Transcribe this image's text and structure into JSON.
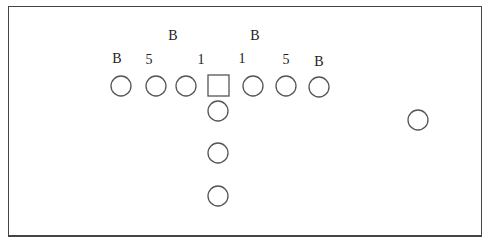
{
  "diagram": {
    "type": "football-formation",
    "labels": [
      {
        "text": "B",
        "x": 173,
        "y": 40
      },
      {
        "text": "B",
        "x": 255,
        "y": 40
      },
      {
        "text": "B",
        "x": 117,
        "y": 63
      },
      {
        "text": "5",
        "x": 149,
        "y": 64
      },
      {
        "text": "1",
        "x": 201,
        "y": 64
      },
      {
        "text": "1",
        "x": 242,
        "y": 63
      },
      {
        "text": "5",
        "x": 286,
        "y": 64
      },
      {
        "text": "B",
        "x": 319,
        "y": 66
      }
    ],
    "center": {
      "shape": "square",
      "x": 208,
      "y": 75,
      "size": 21
    },
    "line_players": [
      {
        "cx": 121,
        "cy": 86
      },
      {
        "cx": 156,
        "cy": 86
      },
      {
        "cx": 186,
        "cy": 86
      },
      {
        "cx": 253,
        "cy": 86
      },
      {
        "cx": 286,
        "cy": 86
      },
      {
        "cx": 319,
        "cy": 87
      }
    ],
    "backfield_players": [
      {
        "cx": 218,
        "cy": 111
      },
      {
        "cx": 218,
        "cy": 153
      },
      {
        "cx": 218,
        "cy": 196
      }
    ],
    "wide_player": {
      "cx": 418,
      "cy": 120
    },
    "radius": 10
  }
}
